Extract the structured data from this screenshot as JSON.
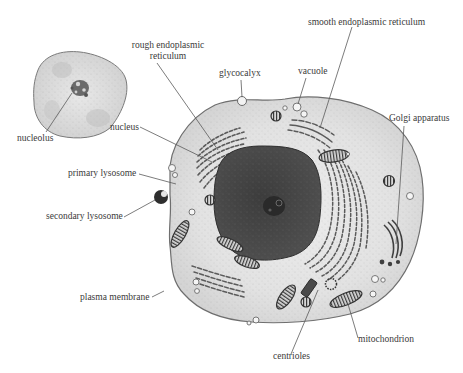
{
  "diagram": {
    "colors": {
      "background": "#ffffff",
      "cytoplasm": "#e6e6e6",
      "cytoplasm_shade": "#cfcfcf",
      "membrane": "#6e6e6e",
      "nucleus": "#4a4a4a",
      "nucleus_dark": "#2e2e2e",
      "organelle": "#5a5a5a",
      "leader_line": "#5a5a5a",
      "label_text": "#3a3a3a"
    },
    "small_cell": {
      "description": "cell nucleus (enlarged inset)",
      "labels": [
        {
          "id": "nucleolus",
          "text": "nucleolus"
        }
      ]
    },
    "labels": {
      "rough_er_line1": "rough endoplasmic",
      "rough_er_line2": "reticulum",
      "glycocalyx": "glycocalyx",
      "vacuole": "vacuole",
      "smooth_er": "smooth endoplasmic reticulum",
      "golgi": "Golgi apparatus",
      "nucleus": "nucleus",
      "nucleolus": "nucleolus",
      "primary_lysosome": "primary lysosome",
      "secondary_lysosome": "secondary lysosome",
      "plasma_membrane": "plasma membrane",
      "centrioles": "centrioles",
      "mitochondrion": "mitochondrion"
    }
  }
}
